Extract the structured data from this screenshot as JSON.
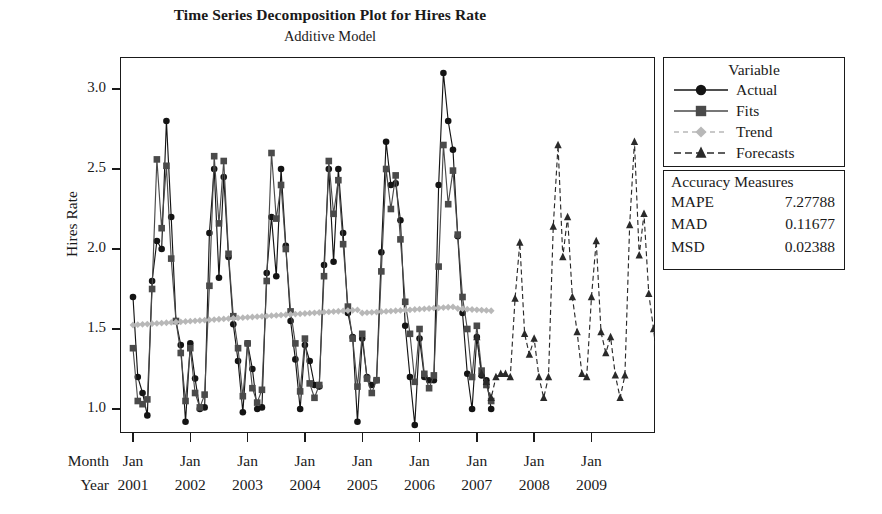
{
  "chart_data": {
    "type": "line",
    "title": "Time Series Decomposition Plot for Hires Rate",
    "subtitle": "Additive Model",
    "xlabel": "",
    "ylabel": "Hires Rate",
    "ylim": [
      0.85,
      3.2
    ],
    "yticks": [
      1.0,
      1.5,
      2.0,
      2.5,
      3.0
    ],
    "ytick_labels": [
      "1.0",
      "1.5",
      "2.0",
      "2.5",
      "3.0"
    ],
    "grid": false,
    "legend_position": "right-outside",
    "x_axis": {
      "row_labels": [
        "Month",
        "Year"
      ],
      "months": [
        "Jan",
        "Jan",
        "Jan",
        "Jan",
        "Jan",
        "Jan",
        "Jan",
        "Jan",
        "Jan"
      ],
      "years": [
        "2001",
        "2002",
        "2003",
        "2004",
        "2005",
        "2006",
        "2007",
        "2008",
        "2009"
      ],
      "index_range": [
        1,
        108
      ],
      "tick_indices": [
        1,
        13,
        25,
        37,
        49,
        61,
        73,
        85,
        97
      ]
    },
    "series": [
      {
        "name": "Actual",
        "marker": "circle",
        "line": "solid",
        "color": "#141414",
        "x_start": 1,
        "values": [
          1.7,
          1.2,
          1.1,
          0.96,
          1.8,
          2.05,
          2.0,
          2.8,
          2.2,
          1.55,
          1.4,
          0.92,
          1.41,
          1.19,
          1.0,
          1.01,
          2.1,
          2.5,
          1.82,
          2.45,
          1.95,
          1.53,
          1.3,
          0.98,
          1.41,
          1.25,
          1.0,
          1.01,
          1.85,
          2.2,
          1.83,
          2.5,
          2.02,
          1.55,
          1.31,
          1.0,
          1.4,
          1.3,
          1.15,
          1.14,
          1.9,
          2.5,
          1.92,
          2.5,
          2.1,
          1.6,
          1.45,
          0.92,
          1.44,
          1.2,
          1.15,
          1.18,
          1.98,
          2.67,
          2.4,
          2.41,
          2.18,
          1.52,
          1.2,
          0.9,
          1.44,
          1.2,
          1.18,
          1.18,
          2.4,
          3.1,
          2.8,
          2.62,
          2.08,
          1.6,
          1.22,
          1.0,
          1.45,
          1.21,
          1.18,
          1.0
        ]
      },
      {
        "name": "Fits",
        "marker": "square",
        "line": "solid",
        "color": "#4a4a4a",
        "x_start": 1,
        "values": [
          1.38,
          1.05,
          1.03,
          1.06,
          1.75,
          2.56,
          2.13,
          2.52,
          1.94,
          1.55,
          1.35,
          1.05,
          1.38,
          1.1,
          1.01,
          1.09,
          1.77,
          2.58,
          2.16,
          2.55,
          1.97,
          1.58,
          1.38,
          1.08,
          1.41,
          1.13,
          1.04,
          1.12,
          1.8,
          2.6,
          2.19,
          2.4,
          2.0,
          1.61,
          1.41,
          1.11,
          1.44,
          1.16,
          1.07,
          1.15,
          1.83,
          2.55,
          2.22,
          2.43,
          2.03,
          1.64,
          1.44,
          1.14,
          1.47,
          1.19,
          1.1,
          1.18,
          1.86,
          2.5,
          2.25,
          2.46,
          2.06,
          1.67,
          1.47,
          1.17,
          1.5,
          1.22,
          1.13,
          1.21,
          1.89,
          2.65,
          2.28,
          2.49,
          2.09,
          1.7,
          1.5,
          1.2,
          1.52,
          1.24,
          1.15,
          1.05
        ]
      },
      {
        "name": "Trend",
        "marker": "diamond",
        "line": "dashed",
        "color": "#b8b8b8",
        "x_start": 1,
        "values": [
          1.525,
          1.527,
          1.529,
          1.531,
          1.533,
          1.535,
          1.537,
          1.539,
          1.541,
          1.543,
          1.545,
          1.547,
          1.549,
          1.551,
          1.553,
          1.555,
          1.557,
          1.559,
          1.561,
          1.563,
          1.565,
          1.567,
          1.569,
          1.571,
          1.573,
          1.575,
          1.577,
          1.579,
          1.581,
          1.583,
          1.585,
          1.587,
          1.589,
          1.591,
          1.593,
          1.595,
          1.597,
          1.599,
          1.601,
          1.603,
          1.605,
          1.607,
          1.609,
          1.611,
          1.613,
          1.615,
          1.617,
          1.619,
          1.6,
          1.602,
          1.604,
          1.606,
          1.608,
          1.61,
          1.612,
          1.614,
          1.616,
          1.618,
          1.62,
          1.622,
          1.624,
          1.626,
          1.628,
          1.63,
          1.632,
          1.634,
          1.636,
          1.638,
          1.628,
          1.626,
          1.624,
          1.622,
          1.62,
          1.618,
          1.616,
          1.614
        ]
      },
      {
        "name": "Forecasts",
        "marker": "triangle",
        "line": "dashed",
        "color": "#2a2a2a",
        "x_start": 73,
        "values": [
          1.45,
          1.22,
          1.17,
          1.07,
          1.2,
          1.22,
          1.22,
          1.2,
          1.69,
          2.04,
          1.47,
          1.34,
          1.44,
          1.2,
          1.07,
          1.2,
          2.14,
          2.65,
          1.95,
          2.2,
          1.7,
          1.48,
          1.22,
          1.2,
          1.7,
          2.05,
          1.48,
          1.35,
          1.45,
          1.21,
          1.07,
          1.21,
          2.15,
          2.67,
          1.96,
          2.22,
          1.72,
          1.5,
          1.23,
          1.21,
          1.71,
          2.06,
          1.49,
          1.36,
          1.46,
          1.22,
          1.08,
          1.22,
          2.1,
          2.7,
          1.93,
          2.48,
          1.58,
          1.08
        ]
      }
    ]
  },
  "legend": {
    "title": "Variable",
    "items": [
      {
        "label": "Actual",
        "marker": "circle",
        "line": "solid",
        "color": "#141414"
      },
      {
        "label": "Fits",
        "marker": "square",
        "line": "solid",
        "color": "#4a4a4a"
      },
      {
        "label": "Trend",
        "marker": "diamond",
        "line": "dashed",
        "color": "#b8b8b8"
      },
      {
        "label": "Forecasts",
        "marker": "triangle",
        "line": "dashed",
        "color": "#2a2a2a"
      }
    ]
  },
  "accuracy": {
    "title": "Accuracy Measures",
    "rows": [
      {
        "key": "MAPE",
        "value": "7.27788"
      },
      {
        "key": "MAD",
        "value": "0.11677"
      },
      {
        "key": "MSD",
        "value": "0.02388"
      }
    ]
  }
}
